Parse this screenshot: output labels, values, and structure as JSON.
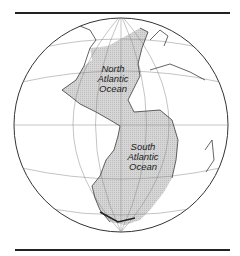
{
  "map": {
    "subject": "Atlantic Ocean on orthographic globe",
    "colors": {
      "ocean_highlight": "#d2d2d2",
      "land": "#ffffff",
      "lines": "#222222",
      "graticule": "#777777"
    },
    "labels": [
      {
        "id": "north",
        "lines": [
          "North",
          "Atlantic",
          "Ocean"
        ]
      },
      {
        "id": "south",
        "lines": [
          "South",
          "Atlantic",
          "Ocean"
        ]
      }
    ]
  }
}
